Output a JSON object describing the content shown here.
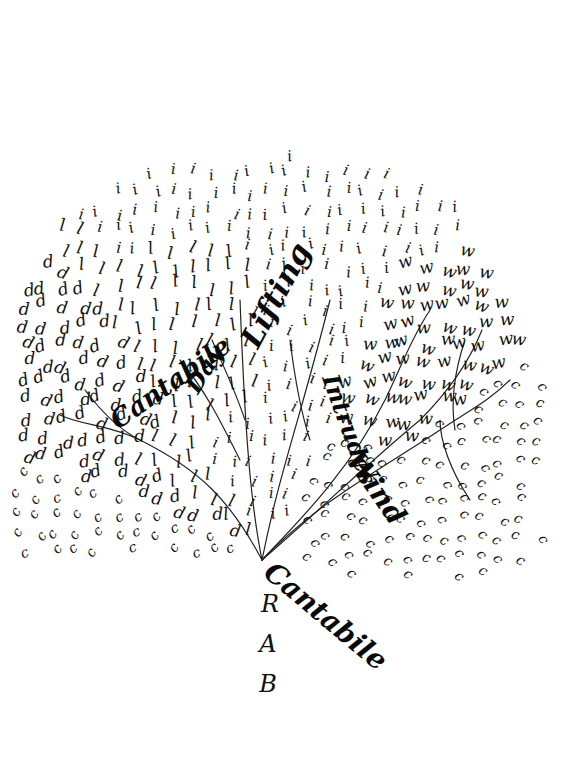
{
  "artwork": {
    "kind": "calligram-tree",
    "background": "#ffffff",
    "ink": "#111111",
    "canopy_letters": {
      "top_region": "i",
      "left_upper_region": "l",
      "left_middle_region": "d",
      "right_upper_region": "w",
      "outer_region": "c"
    },
    "words": [
      {
        "text": "Lifting",
        "x": 258,
        "y": 350,
        "size": 30,
        "rotate": 62
      },
      {
        "text": "Day",
        "x": 198,
        "y": 395,
        "size": 24,
        "rotate": 58
      },
      {
        "text": "Cantabile",
        "x": 118,
        "y": 430,
        "size": 26,
        "rotate": 35
      },
      {
        "text": "Intrudes",
        "x": 322,
        "y": 378,
        "size": 24,
        "rotate": -70
      },
      {
        "text": "Wind",
        "x": 345,
        "y": 460,
        "size": 28,
        "rotate": -55
      },
      {
        "text": "Cantabile",
        "x": 262,
        "y": 575,
        "size": 28,
        "rotate": -40
      }
    ],
    "monogram": [
      {
        "text": "R",
        "x": 270,
        "y": 612,
        "size": 24
      },
      {
        "text": "A",
        "x": 268,
        "y": 652,
        "size": 24
      },
      {
        "text": "B",
        "x": 268,
        "y": 692,
        "size": 24
      }
    ]
  }
}
